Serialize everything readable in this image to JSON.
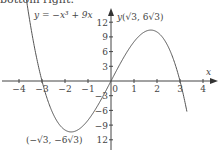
{
  "caption": "bottom right.",
  "chart_data": {
    "type": "line",
    "title": "",
    "equation_label": "y = −x³ + 9x",
    "xlabel": "x",
    "ylabel": "y",
    "x_ticks": [
      -4,
      -3,
      -2,
      -1,
      0,
      1,
      2,
      3,
      4
    ],
    "y_ticks": [
      12,
      9,
      6,
      3,
      -3,
      -6,
      -9,
      -12
    ],
    "x_tick_labels": [
      "−4",
      "−3",
      "−2",
      "−1",
      "0",
      "1",
      "2",
      "3",
      "4"
    ],
    "y_tick_labels": [
      "12",
      "9",
      "6",
      "3",
      "−3",
      "−6",
      "−9",
      "12"
    ],
    "xlim": [
      -4.6,
      4.6
    ],
    "ylim": [
      -14,
      16
    ],
    "series": [
      {
        "name": "y = -x^3 + 9x",
        "function": "-x^3+9x",
        "x_range": [
          -3.8,
          3.3
        ]
      }
    ],
    "annotations": [
      {
        "text": "(√3, 6√3)",
        "x": 1.732,
        "y": 10.392
      },
      {
        "text": "(−√3, −6√3)",
        "x": -1.732,
        "y": -10.392
      }
    ],
    "grid": false
  }
}
